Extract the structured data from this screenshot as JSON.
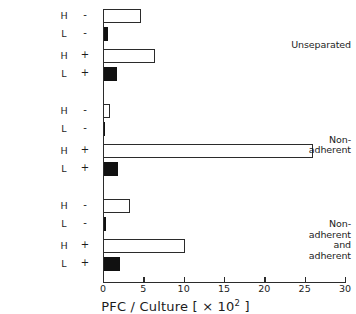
{
  "chart_data": {
    "type": "bar",
    "orientation": "horizontal",
    "title": "",
    "xlabel": "PFC / Culture  [ × 10² ]",
    "ylabel": "",
    "xlim": [
      0,
      30
    ],
    "xticks": [
      0,
      5,
      10,
      15,
      20,
      25,
      30
    ],
    "xticklabels": [
      "0",
      "5",
      "10",
      "15",
      "20",
      "25",
      "30"
    ],
    "grid": false,
    "legend": "none",
    "groups": [
      {
        "name": "Unseparated",
        "rows": [
          {
            "cell_type": "H",
            "treatment": "-",
            "value": 4.7,
            "fill": "open"
          },
          {
            "cell_type": "L",
            "treatment": "-",
            "value": 0.6,
            "fill": "filled"
          },
          {
            "cell_type": "H",
            "treatment": "+",
            "value": 6.4,
            "fill": "open"
          },
          {
            "cell_type": "L",
            "treatment": "+",
            "value": 1.7,
            "fill": "filled"
          }
        ]
      },
      {
        "name": "Non-adherent",
        "rows": [
          {
            "cell_type": "H",
            "treatment": "-",
            "value": 0.9,
            "fill": "open"
          },
          {
            "cell_type": "L",
            "treatment": "-",
            "value": 0.05,
            "fill": "filled"
          },
          {
            "cell_type": "H",
            "treatment": "+",
            "value": 26.0,
            "fill": "open"
          },
          {
            "cell_type": "L",
            "treatment": "+",
            "value": 1.9,
            "fill": "filled"
          }
        ]
      },
      {
        "name": "Non-adherent\nand\nadherent",
        "rows": [
          {
            "cell_type": "H",
            "treatment": "-",
            "value": 3.3,
            "fill": "open"
          },
          {
            "cell_type": "L",
            "treatment": "-",
            "value": 0.4,
            "fill": "filled"
          },
          {
            "cell_type": "H",
            "treatment": "+",
            "value": 10.2,
            "fill": "open"
          },
          {
            "cell_type": "L",
            "treatment": "+",
            "value": 2.1,
            "fill": "filled"
          }
        ]
      }
    ],
    "colors": {
      "open_bar_face": "#ffffff",
      "open_bar_edge": "#2b2b2b",
      "filled_bar": "#111111",
      "axis": "#2b2b2b",
      "text": "#1c1c1c",
      "background": "#ffffff"
    }
  },
  "axis_title_parts": {
    "main": "PFC / Culture  [ × 10",
    "exponent": "2",
    "tail": " ]"
  }
}
